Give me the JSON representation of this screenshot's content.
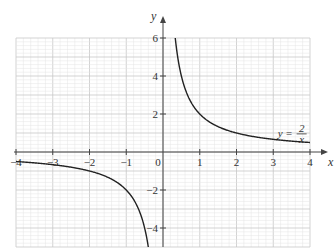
{
  "chart_data": {
    "type": "line",
    "title": "",
    "xlabel": "x",
    "ylabel": "y",
    "xlim": [
      -4,
      4
    ],
    "ylim": [
      -5,
      6
    ],
    "grid": true,
    "x_ticks": [
      -4,
      -3,
      -2,
      -1,
      0,
      1,
      2,
      3,
      4
    ],
    "x_tick_labels": [
      "−4",
      "−3",
      "−2",
      "−1",
      "0",
      "1",
      "2",
      "3",
      "4"
    ],
    "y_ticks": [
      -4,
      -2,
      2,
      4,
      6
    ],
    "y_tick_labels": [
      "−4",
      "−2",
      "2",
      "4",
      "6"
    ],
    "series": [
      {
        "name": "y = 2/x",
        "function": "2/x",
        "branches": [
          {
            "x": [
              0.333,
              0.4,
              0.5,
              0.75,
              1,
              1.5,
              2,
              2.5,
              3,
              3.5,
              4
            ],
            "y": [
              6,
              5,
              4,
              2.667,
              2,
              1.333,
              1,
              0.8,
              0.667,
              0.571,
              0.5
            ]
          },
          {
            "x": [
              -4,
              -3.5,
              -3,
              -2.5,
              -2,
              -1.5,
              -1,
              -0.75,
              -0.5,
              -0.4
            ],
            "y": [
              -0.5,
              -0.571,
              -0.667,
              -0.8,
              -1,
              -1.333,
              -2,
              -2.667,
              -4,
              -5
            ]
          }
        ]
      }
    ],
    "annotations": [
      {
        "text_lhs": "y =",
        "numerator": "2",
        "denominator": "x",
        "near": [
          3.5,
          0.9
        ]
      }
    ]
  },
  "colors": {
    "grid_minor": "#e4e4e4",
    "grid_major": "#c8c8c8",
    "axis": "#444444",
    "curve": "#222222"
  }
}
